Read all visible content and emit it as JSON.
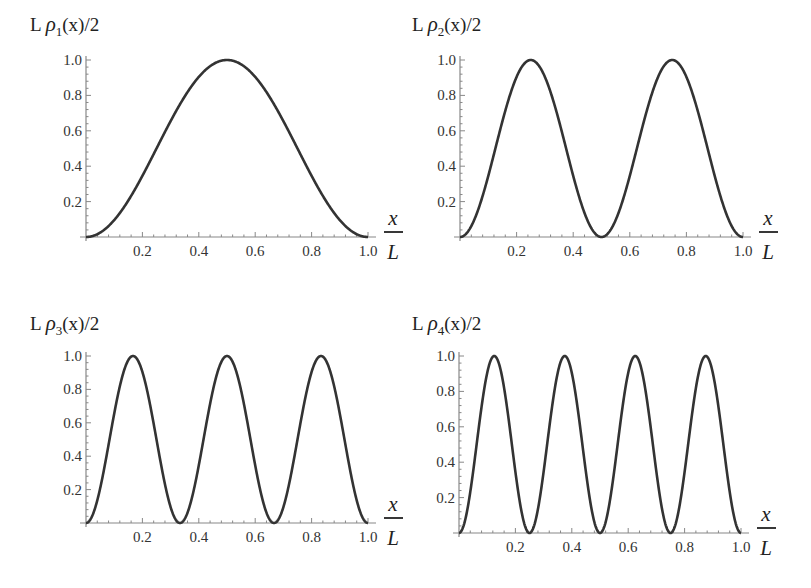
{
  "chart_data": [
    {
      "type": "line",
      "title": "L ρ1(x)/2",
      "title_prefix": "L ",
      "title_symbol": "ρ",
      "title_sub": "1",
      "title_suffix": "(x)/2",
      "n": 1,
      "xlabel_num": "x",
      "xlabel_den": "L",
      "xlim": [
        0,
        1.0
      ],
      "ylim": [
        0,
        1.0
      ],
      "xticks": [
        "0.2",
        "0.4",
        "0.6",
        "0.8",
        "1.0"
      ],
      "yticks": [
        "0.2",
        "0.4",
        "0.6",
        "0.8",
        "1.0"
      ],
      "x": [
        0,
        0.1,
        0.2,
        0.3,
        0.4,
        0.5,
        0.6,
        0.7,
        0.8,
        0.9,
        1.0
      ],
      "values": [
        0,
        0.095,
        0.345,
        0.655,
        0.905,
        1.0,
        0.905,
        0.655,
        0.345,
        0.095,
        0
      ],
      "grid": false
    },
    {
      "type": "line",
      "title": "L ρ2(x)/2",
      "title_prefix": "L ",
      "title_symbol": "ρ",
      "title_sub": "2",
      "title_suffix": "(x)/2",
      "n": 2,
      "xlabel_num": "x",
      "xlabel_den": "L",
      "xlim": [
        0,
        1.0
      ],
      "ylim": [
        0,
        1.0
      ],
      "xticks": [
        "0.2",
        "0.4",
        "0.6",
        "0.8",
        "1.0"
      ],
      "yticks": [
        "0.2",
        "0.4",
        "0.6",
        "0.8",
        "1.0"
      ],
      "x": [
        0,
        0.125,
        0.25,
        0.375,
        0.5,
        0.625,
        0.75,
        0.875,
        1.0
      ],
      "values": [
        0,
        0.5,
        1.0,
        0.5,
        0,
        0.5,
        1.0,
        0.5,
        0
      ],
      "grid": false
    },
    {
      "type": "line",
      "title": "L ρ3(x)/2",
      "title_prefix": "L ",
      "title_symbol": "ρ",
      "title_sub": "3",
      "title_suffix": "(x)/2",
      "n": 3,
      "xlabel_num": "x",
      "xlabel_den": "L",
      "xlim": [
        0,
        1.0
      ],
      "ylim": [
        0,
        1.0
      ],
      "xticks": [
        "0.2",
        "0.4",
        "0.6",
        "0.8",
        "1.0"
      ],
      "yticks": [
        "0.2",
        "0.4",
        "0.6",
        "0.8",
        "1.0"
      ],
      "x": [
        0,
        0.167,
        0.333,
        0.5,
        0.667,
        0.833,
        1.0
      ],
      "values": [
        0,
        1.0,
        0,
        1.0,
        0,
        1.0,
        0
      ],
      "grid": false
    },
    {
      "type": "line",
      "title": "L ρ4(x)/2",
      "title_prefix": "L ",
      "title_symbol": "ρ",
      "title_sub": "4",
      "title_suffix": "(x)/2",
      "n": 4,
      "xlabel_num": "x",
      "xlabel_den": "L",
      "xlim": [
        0,
        1.0
      ],
      "ylim": [
        0,
        1.0
      ],
      "xticks": [
        "0.2",
        "0.4",
        "0.6",
        "0.8",
        "1.0"
      ],
      "yticks": [
        "0.2",
        "0.4",
        "0.6",
        "0.8",
        "1.0"
      ],
      "x": [
        0,
        0.125,
        0.25,
        0.375,
        0.5,
        0.625,
        0.75,
        0.875,
        1.0
      ],
      "values": [
        0,
        1.0,
        0,
        1.0,
        0,
        1.0,
        0,
        1.0,
        0
      ],
      "grid": false
    }
  ],
  "layout": {
    "panels": [
      {
        "x0": 86,
        "x1": 368,
        "y0": 237,
        "y1": 60,
        "title_x": 30,
        "title_y": 31
      },
      {
        "x0": 460,
        "x1": 743,
        "y0": 237,
        "y1": 60,
        "title_x": 412,
        "title_y": 31
      },
      {
        "x0": 86,
        "x1": 368,
        "y0": 523,
        "y1": 356,
        "title_x": 30,
        "title_y": 330
      },
      {
        "x0": 459,
        "x1": 741,
        "y0": 533,
        "y1": 356,
        "title_x": 412,
        "title_y": 330
      }
    ],
    "line_color": "#333333",
    "axis_color": "#888888"
  }
}
